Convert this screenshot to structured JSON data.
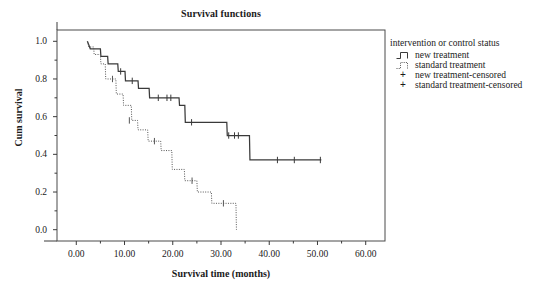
{
  "chart_data": {
    "type": "line",
    "title": "Survival functions",
    "xlabel": "Survival time (months)",
    "ylabel": "Cum survival",
    "xlim": [
      -4,
      64
    ],
    "ylim": [
      -0.06,
      1.06
    ],
    "xticks": [
      "0.00",
      "10.00",
      "20.00",
      "30.00",
      "40.00",
      "50.00",
      "60.00"
    ],
    "xtick_values": [
      0,
      10,
      20,
      30,
      40,
      50,
      60
    ],
    "yticks": [
      "1.0",
      "0.8",
      "0.6",
      "0.4",
      "0.2",
      "0.0"
    ],
    "ytick_values": [
      1.0,
      0.8,
      0.6,
      0.4,
      0.2,
      0.0
    ],
    "grid": false,
    "legend_position": "right",
    "legend_title": "intervention or control status",
    "series": [
      {
        "name": "new treatment",
        "style": "solid",
        "color": "#3a3a3a",
        "steps": [
          [
            2.3,
            1.0
          ],
          [
            2.9,
            0.96
          ],
          [
            5.0,
            0.96
          ],
          [
            5.1,
            0.92
          ],
          [
            6.5,
            0.92
          ],
          [
            6.6,
            0.88
          ],
          [
            8.6,
            0.88
          ],
          [
            8.7,
            0.84
          ],
          [
            10.1,
            0.84
          ],
          [
            10.2,
            0.79
          ],
          [
            12.8,
            0.79
          ],
          [
            12.9,
            0.75
          ],
          [
            15.1,
            0.75
          ],
          [
            15.2,
            0.7
          ],
          [
            21.3,
            0.7
          ],
          [
            21.4,
            0.66
          ],
          [
            22.5,
            0.66
          ],
          [
            22.6,
            0.57
          ],
          [
            31.2,
            0.57
          ],
          [
            31.3,
            0.5
          ],
          [
            35.9,
            0.5
          ],
          [
            36.0,
            0.37
          ],
          [
            50.8,
            0.37
          ]
        ],
        "censored": [
          [
            9.2,
            0.84
          ],
          [
            11.6,
            0.79
          ],
          [
            17.0,
            0.7
          ],
          [
            18.8,
            0.7
          ],
          [
            19.6,
            0.7
          ],
          [
            23.9,
            0.57
          ],
          [
            31.6,
            0.5
          ],
          [
            32.8,
            0.5
          ],
          [
            33.6,
            0.5
          ],
          [
            41.7,
            0.37
          ],
          [
            45.2,
            0.37
          ],
          [
            50.6,
            0.37
          ]
        ]
      },
      {
        "name": "standard treatment",
        "style": "dotted",
        "color": "#555555",
        "steps": [
          [
            2.3,
            1.0
          ],
          [
            2.6,
            0.97
          ],
          [
            3.6,
            0.97
          ],
          [
            3.7,
            0.93
          ],
          [
            5.0,
            0.93
          ],
          [
            5.1,
            0.88
          ],
          [
            6.0,
            0.88
          ],
          [
            6.1,
            0.8
          ],
          [
            8.2,
            0.8
          ],
          [
            8.3,
            0.72
          ],
          [
            9.7,
            0.72
          ],
          [
            9.8,
            0.66
          ],
          [
            11.4,
            0.66
          ],
          [
            11.5,
            0.58
          ],
          [
            12.7,
            0.58
          ],
          [
            12.8,
            0.53
          ],
          [
            14.8,
            0.53
          ],
          [
            14.9,
            0.47
          ],
          [
            17.5,
            0.47
          ],
          [
            17.6,
            0.42
          ],
          [
            19.8,
            0.42
          ],
          [
            19.9,
            0.32
          ],
          [
            22.4,
            0.32
          ],
          [
            22.5,
            0.26
          ],
          [
            25.0,
            0.26
          ],
          [
            25.1,
            0.2
          ],
          [
            28.0,
            0.2
          ],
          [
            28.1,
            0.14
          ],
          [
            33.1,
            0.14
          ],
          [
            33.2,
            0.0
          ]
        ],
        "censored": [
          [
            7.5,
            0.8
          ],
          [
            11.0,
            0.58
          ],
          [
            16.2,
            0.47
          ],
          [
            24.0,
            0.26
          ],
          [
            30.5,
            0.14
          ]
        ]
      }
    ],
    "legend_entries": [
      {
        "label": "new treatment",
        "symbol": "step-solid"
      },
      {
        "label": "standard treatment",
        "symbol": "step-dotted"
      },
      {
        "label": "new treatment-censored",
        "symbol": "plus"
      },
      {
        "label": "standard treatment-censored",
        "symbol": "plus"
      }
    ]
  },
  "colors": {
    "axis": "#3a3a3a",
    "frame": "#4a4a4a",
    "text": "#1a1a1a",
    "new_treatment": "#3a3a3a",
    "standard_treatment": "#555555"
  }
}
